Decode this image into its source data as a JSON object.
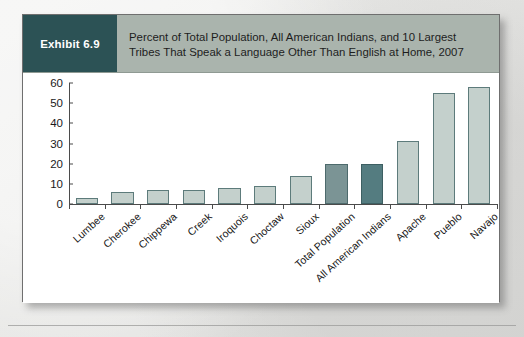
{
  "exhibit": {
    "badge_label": "Exhibit 6.9",
    "title": "Percent of Total Population, All American Indians, and 10 Largest Tribes That Speak a Language Other Than English at Home, 2007",
    "badge_color": "#2c5255",
    "header_color": "#aab4ad"
  },
  "chart_data": {
    "type": "bar",
    "title": "Percent of Total Population, All American Indians, and 10 Largest Tribes That Speak a Language Other Than English at Home, 2007",
    "xlabel": "",
    "ylabel": "",
    "ylim": [
      0,
      60
    ],
    "yticks": [
      0,
      10,
      20,
      30,
      40,
      50,
      60
    ],
    "grid": false,
    "legend": "none",
    "categories": [
      "Lumbee",
      "Cherokee",
      "Chippewa",
      "Creek",
      "Iroquois",
      "Choctaw",
      "Sioux",
      "Total Population",
      "All American Indians",
      "Apache",
      "Pueblo",
      "Navajo"
    ],
    "values": [
      3,
      6,
      7,
      7,
      8,
      9,
      14,
      20,
      20,
      31,
      55,
      58
    ],
    "bar_colors": [
      "#c4d0cc",
      "#c4d0cc",
      "#c4d0cc",
      "#c4d0cc",
      "#c4d0cc",
      "#c4d0cc",
      "#c4d0cc",
      "#7b9495",
      "#547c80",
      "#c4d0cc",
      "#c4d0cc",
      "#c4d0cc"
    ],
    "highlighted": [
      "Total Population",
      "All American Indians"
    ]
  }
}
